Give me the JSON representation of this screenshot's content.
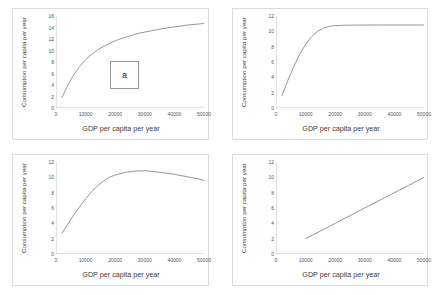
{
  "figure": {
    "panels": [
      {
        "tag": "a",
        "xlabel": "GDP per capita per year",
        "ylabel": "Consumption per capita per year",
        "xticks": [
          "0",
          "10000",
          "20000",
          "30000",
          "40000",
          "50000"
        ],
        "yticks": [
          "0",
          "2",
          "4",
          "6",
          "8",
          "10",
          "12",
          "14",
          "16"
        ]
      },
      {
        "tag": "b",
        "xlabel": "GDP per capita per year",
        "ylabel": "Consumption per capita per year",
        "xticks": [
          "0",
          "10000",
          "20000",
          "30000",
          "40000",
          "50000"
        ],
        "yticks": [
          "0",
          "2",
          "4",
          "6",
          "8",
          "10",
          "12"
        ]
      },
      {
        "tag": "c",
        "xlabel": "GDP per capita per year",
        "ylabel": "Consumption per capita per year",
        "xticks": [
          "0",
          "10000",
          "20000",
          "30000",
          "40000",
          "50000"
        ],
        "yticks": [
          "0",
          "2",
          "4",
          "6",
          "8",
          "10",
          "12"
        ]
      },
      {
        "tag": "d",
        "xlabel": "GDP per capita per year",
        "ylabel": "Consumption per capita per year",
        "xticks": [
          "0",
          "10000",
          "20000",
          "30000",
          "40000",
          "50000"
        ],
        "yticks": [
          "0",
          "2",
          "4",
          "6",
          "8",
          "10",
          "12"
        ]
      }
    ]
  },
  "chart_data": [
    {
      "type": "line",
      "title": "a",
      "xlabel": "GDP per capita per year",
      "ylabel": "Consumption per capita per year",
      "xlim": [
        0,
        50000
      ],
      "ylim": [
        0,
        16
      ],
      "grid": false,
      "legend": "none",
      "series": [
        {
          "name": "consumption-a",
          "x": [
            2000,
            4000,
            6000,
            8000,
            10000,
            12000,
            14000,
            16000,
            18000,
            20000,
            24000,
            28000,
            32000,
            36000,
            40000,
            44000,
            48000,
            50000
          ],
          "y": [
            1.8,
            4.0,
            5.8,
            7.2,
            8.4,
            9.3,
            10.1,
            10.7,
            11.2,
            11.7,
            12.4,
            13.0,
            13.4,
            13.8,
            14.1,
            14.4,
            14.6,
            14.7
          ]
        }
      ]
    },
    {
      "type": "line",
      "title": "b",
      "xlabel": "GDP per capita per year",
      "ylabel": "Consumption per capita per year",
      "xlim": [
        0,
        50000
      ],
      "ylim": [
        0,
        12
      ],
      "grid": false,
      "legend": "none",
      "series": [
        {
          "name": "consumption-b",
          "x": [
            2000,
            4000,
            6000,
            8000,
            10000,
            12000,
            14000,
            16000,
            18000,
            20000,
            24000,
            30000,
            36000,
            42000,
            48000,
            50000
          ],
          "y": [
            1.6,
            3.6,
            5.4,
            7.0,
            8.3,
            9.3,
            10.0,
            10.4,
            10.65,
            10.75,
            10.8,
            10.82,
            10.83,
            10.83,
            10.83,
            10.83
          ]
        }
      ]
    },
    {
      "type": "line",
      "title": "c",
      "xlabel": "GDP per capita per year",
      "ylabel": "Consumption per capita per year",
      "xlim": [
        0,
        50000
      ],
      "ylim": [
        0,
        12
      ],
      "grid": false,
      "legend": "none",
      "series": [
        {
          "name": "consumption-c",
          "x": [
            2000,
            4000,
            6000,
            8000,
            10000,
            12000,
            14000,
            16000,
            18000,
            20000,
            24000,
            28000,
            30000,
            32000,
            36000,
            40000,
            44000,
            48000,
            50000
          ],
          "y": [
            2.7,
            3.9,
            5.1,
            6.2,
            7.2,
            8.1,
            8.9,
            9.5,
            10.0,
            10.3,
            10.7,
            10.85,
            10.85,
            10.8,
            10.6,
            10.4,
            10.1,
            9.8,
            9.6
          ]
        }
      ]
    },
    {
      "type": "line",
      "title": "d",
      "xlabel": "GDP per capita per year",
      "ylabel": "Consumption per capita per year",
      "xlim": [
        0,
        50000
      ],
      "ylim": [
        0,
        12
      ],
      "grid": false,
      "legend": "none",
      "series": [
        {
          "name": "consumption-d",
          "x": [
            10000,
            20000,
            30000,
            40000,
            50000
          ],
          "y": [
            2.0,
            4.0,
            6.0,
            8.0,
            10.0
          ]
        }
      ]
    }
  ]
}
